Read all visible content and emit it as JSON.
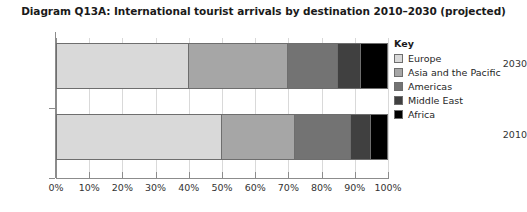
{
  "chart_data": {
    "type": "bar",
    "orientation": "horizontal",
    "stacked": true,
    "normalized_percent": true,
    "title": "Diagram Q13A: International tourist arrivals by destination 2010–2030 (projected)",
    "xlabel": "",
    "ylabel": "",
    "categories": [
      "2030",
      "2010"
    ],
    "series": [
      {
        "name": "Europe",
        "values": [
          40,
          50
        ],
        "color": "#d9d9d9"
      },
      {
        "name": "Asia and the Pacific",
        "values": [
          30,
          22
        ],
        "color": "#a6a6a6"
      },
      {
        "name": "Americas",
        "values": [
          15,
          17
        ],
        "color": "#737373"
      },
      {
        "name": "Middle East",
        "values": [
          7,
          6
        ],
        "color": "#404040"
      },
      {
        "name": "Africa",
        "values": [
          8,
          5
        ],
        "color": "#000000"
      }
    ],
    "xlim": [
      0,
      100
    ],
    "xticks": [
      0,
      10,
      20,
      30,
      40,
      50,
      60,
      70,
      80,
      90,
      100
    ],
    "xtick_labels": [
      "0%",
      "10%",
      "20%",
      "30%",
      "40%",
      "50%",
      "60%",
      "70%",
      "80%",
      "90%",
      "100%"
    ],
    "grid": true,
    "grid_axis": "x",
    "legend_position": "right",
    "legend_title": "Key"
  },
  "legend": {
    "title": "Key",
    "items": [
      {
        "label": "Europe",
        "color": "#d9d9d9"
      },
      {
        "label": "Asia and the Pacific",
        "color": "#a6a6a6"
      },
      {
        "label": "Americas",
        "color": "#737373"
      },
      {
        "label": "Middle East",
        "color": "#404040"
      },
      {
        "label": "Africa",
        "color": "#000000"
      }
    ]
  },
  "axes": {
    "y_labels": [
      "2030",
      "2010"
    ],
    "x_labels": [
      "0%",
      "10%",
      "20%",
      "30%",
      "40%",
      "50%",
      "60%",
      "70%",
      "80%",
      "90%",
      "100%"
    ]
  },
  "colors": {
    "axis": "#8c8c8c",
    "gridline": "#d9d9d9",
    "bar_outline": "#6e6e6e",
    "text": "#333333",
    "title_text": "#1a1a1a",
    "background": "#ffffff"
  }
}
